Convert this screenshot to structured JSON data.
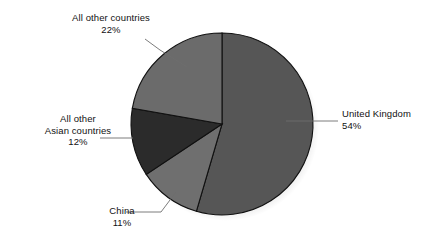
{
  "chart_data": {
    "type": "pie",
    "title": "",
    "subtitle": "",
    "xlabel": "",
    "ylabel": "",
    "legend_position": "none",
    "grid": false,
    "units": "percent",
    "start_angle_deg": 0,
    "direction": "clockwise",
    "categories": [
      "United Kingdom",
      "China",
      "All other Asian countries",
      "All other countries"
    ],
    "values": [
      54,
      11,
      12,
      22
    ],
    "slices": [
      {
        "label": "United Kingdom",
        "label_line1": "United Kingdom",
        "label_line2": "54%",
        "value": 54,
        "value_text": "54%",
        "color": "#565656"
      },
      {
        "label": "China",
        "label_line1": "China",
        "label_line2": "11%",
        "value": 11,
        "value_text": "11%",
        "color": "#6f6f6f"
      },
      {
        "label": "All other Asian countries",
        "label_line1": "All other",
        "label_line2": "Asian countries",
        "label_line3": "12%",
        "value": 12,
        "value_text": "12%",
        "color": "#2b2b2b"
      },
      {
        "label": "All other countries",
        "label_line1": "All other countries",
        "label_line2": "22%",
        "value": 22,
        "value_text": "22%",
        "color": "#6b6b6b"
      }
    ],
    "colors": {
      "background": "#ffffff",
      "slice_outline": "#111111",
      "leader_line": "#6d6d6d",
      "text": "#111111"
    }
  }
}
